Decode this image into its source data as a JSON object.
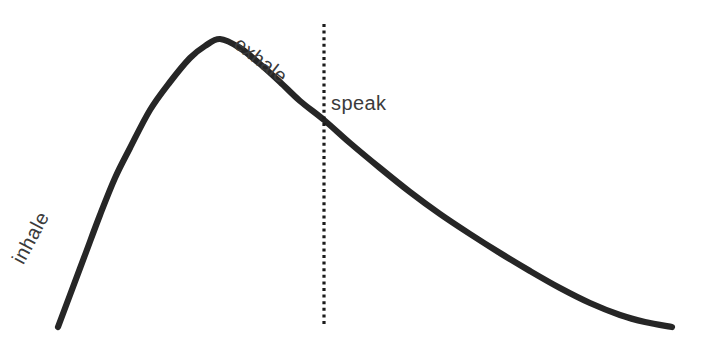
{
  "figure": {
    "title": "",
    "background_color": "#ffffff",
    "curve_color": "#262626",
    "marker_color": "#1c1c1c",
    "label_color": "#3b3b3b"
  },
  "labels": {
    "inhale": "inhale",
    "exhale": "exhale",
    "speak": "speak"
  },
  "chart_data": {
    "type": "line",
    "title": "",
    "xlabel": "",
    "ylabel": "",
    "grid": false,
    "legend": "none",
    "xlim": [
      0,
      703
    ],
    "ylim": [
      345,
      0
    ],
    "annotations": [
      {
        "text": "inhale",
        "x": 58,
        "y": 275,
        "rotation": -62,
        "phase": "rising"
      },
      {
        "text": "exhale",
        "x": 250,
        "y": 60,
        "rotation": 38,
        "phase": "falling"
      },
      {
        "text": "speak",
        "x": 331,
        "y": 104,
        "rotation": 0,
        "phase": "post-marker"
      }
    ],
    "marker_line": {
      "label": "speak-onset",
      "x": 324,
      "y_top": 24,
      "y_bottom": 326,
      "style": "dotted"
    },
    "series": [
      {
        "name": "breath-pressure",
        "x": [
          58,
          70,
          85,
          100,
          115,
          130,
          150,
          170,
          190,
          205,
          220,
          240,
          260,
          280,
          300,
          324,
          350,
          380,
          410,
          440,
          470,
          500,
          530,
          560,
          590,
          620,
          645,
          672
        ],
        "y": [
          327,
          295,
          255,
          215,
          178,
          148,
          110,
          82,
          58,
          46,
          39,
          48,
          64,
          82,
          101,
          120,
          143,
          168,
          192,
          214,
          234,
          253,
          271,
          288,
          303,
          315,
          322,
          327
        ]
      }
    ]
  }
}
